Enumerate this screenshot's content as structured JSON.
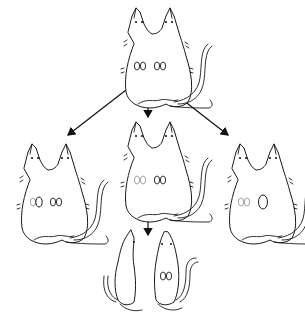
{
  "diagram": {
    "title": "",
    "colors": {
      "line": "#1a1a1a",
      "faint": "#9a9a9a",
      "background": "#ffffff"
    },
    "nodes": [
      {
        "id": "top",
        "label": "",
        "type": "parabiotic-pair",
        "kidneys": {
          "left": "normal-pair",
          "right": "normal-pair"
        }
      },
      {
        "id": "left",
        "label": "",
        "type": "parabiotic-pair",
        "kidneys": {
          "left": "one-removed",
          "right": "normal-pair"
        }
      },
      {
        "id": "middle",
        "label": "",
        "type": "parabiotic-pair",
        "kidneys": {
          "left": "faint-pair",
          "right": "normal-pair"
        }
      },
      {
        "id": "right",
        "label": "",
        "type": "parabiotic-pair",
        "kidneys": {
          "left": "faint-pair",
          "right": "one-enlarged"
        }
      },
      {
        "id": "separated-left",
        "label": "",
        "type": "single-mouse-side-view"
      },
      {
        "id": "separated-right",
        "label": "",
        "type": "single-mouse",
        "kidneys": "normal-pair"
      }
    ],
    "edges": [
      {
        "from": "top",
        "to": "left"
      },
      {
        "from": "top",
        "to": "middle"
      },
      {
        "from": "top",
        "to": "right"
      },
      {
        "from": "middle",
        "to": "separated"
      }
    ]
  }
}
